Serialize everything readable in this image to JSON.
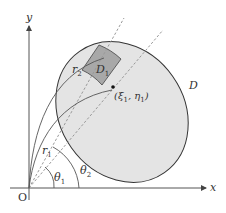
{
  "diagram": {
    "axes": {
      "x_label": "x",
      "y_label": "y",
      "origin_label": "O"
    },
    "region": {
      "label": "D",
      "fill": "#e4e4e4",
      "stroke": "#333333"
    },
    "subregion": {
      "label": "D",
      "label_sub": "1",
      "fill": "#a8a8a8"
    },
    "point": {
      "label_pre": "(ξ",
      "label_sub1": "1",
      "label_mid": ", η",
      "label_sub2": "1",
      "label_post": ")"
    },
    "radii": [
      {
        "label": "r",
        "sub": "1"
      },
      {
        "label": "r",
        "sub": "2"
      }
    ],
    "angles": [
      {
        "label": "θ",
        "sub": "1"
      },
      {
        "label": "θ",
        "sub": "2"
      }
    ],
    "colors": {
      "axis": "#555555",
      "dashed": "#999999",
      "arc": "#555555"
    }
  }
}
